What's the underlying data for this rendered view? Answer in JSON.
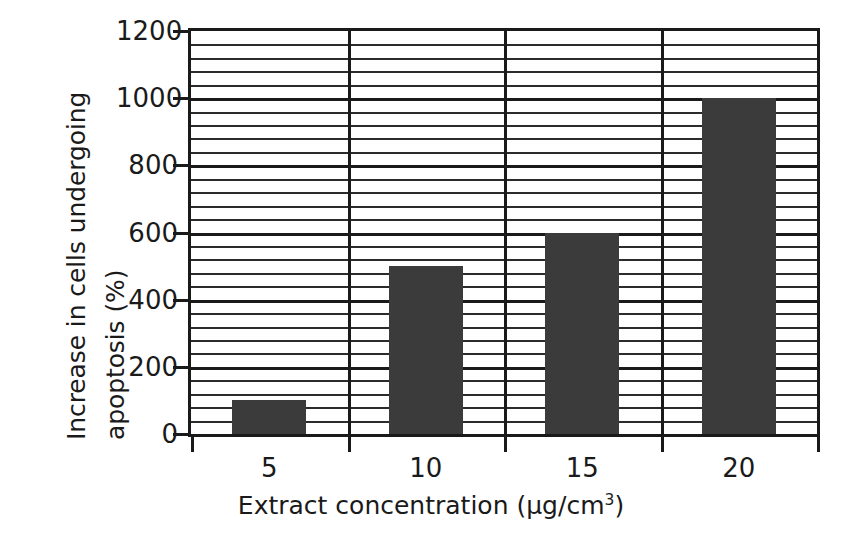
{
  "chart_data": {
    "type": "bar",
    "title": "",
    "categories": [
      "5",
      "10",
      "15",
      "20"
    ],
    "values": [
      100,
      500,
      600,
      1000
    ],
    "series": [
      {
        "name": "Increase in cells undergoing apoptosis",
        "values": [
          100,
          500,
          600,
          1000
        ]
      }
    ],
    "xlabel_text": "Extract concentration (µg/cm",
    "xlabel_sup": "3",
    "xlabel_tail": ")",
    "xlabel_full": "Extract concentration (µg/cm3)",
    "ylabel_line1": "Increase in cells undergoing",
    "ylabel_line2": "apoptosis (%)",
    "ylabel_full": "Increase in cells undergoing apoptosis (%)",
    "ylim": [
      0,
      1200
    ],
    "ytick_values": [
      0,
      200,
      400,
      600,
      800,
      1000,
      1200
    ],
    "ytick_labels": [
      "0",
      "200",
      "400",
      "600",
      "800",
      "1000",
      "1200"
    ],
    "minor_tick_step": 40,
    "grid": true,
    "grid_axis": "y",
    "legend": false,
    "legend_position": "none",
    "bar_color": "#3b3b3b",
    "axis_color": "#1a1a1a",
    "grid_color": "#2b2b2b",
    "background_color": "#ffffff"
  }
}
